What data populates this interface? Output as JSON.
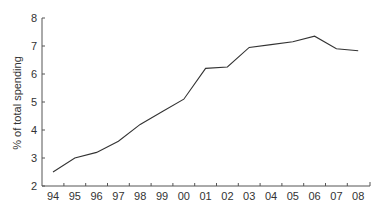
{
  "chart_data": {
    "type": "line",
    "title": "",
    "xlabel": "",
    "ylabel": "% of total spending",
    "categories": [
      "94",
      "95",
      "96",
      "97",
      "98",
      "99",
      "00",
      "01",
      "02",
      "03",
      "04",
      "05",
      "06",
      "07",
      "08"
    ],
    "series": [
      {
        "name": "% of total spending",
        "values": [
          2.5,
          3.0,
          3.2,
          3.6,
          4.2,
          4.65,
          5.1,
          6.2,
          6.25,
          6.95,
          7.05,
          7.15,
          7.35,
          6.9,
          6.83
        ]
      }
    ],
    "ylim": [
      2,
      8
    ],
    "yticks": [
      2,
      3,
      4,
      5,
      6,
      7,
      8
    ],
    "grid": false,
    "legend": "none",
    "colors": {
      "line": "#333333",
      "axis": "#555555",
      "text": "#333333"
    }
  }
}
